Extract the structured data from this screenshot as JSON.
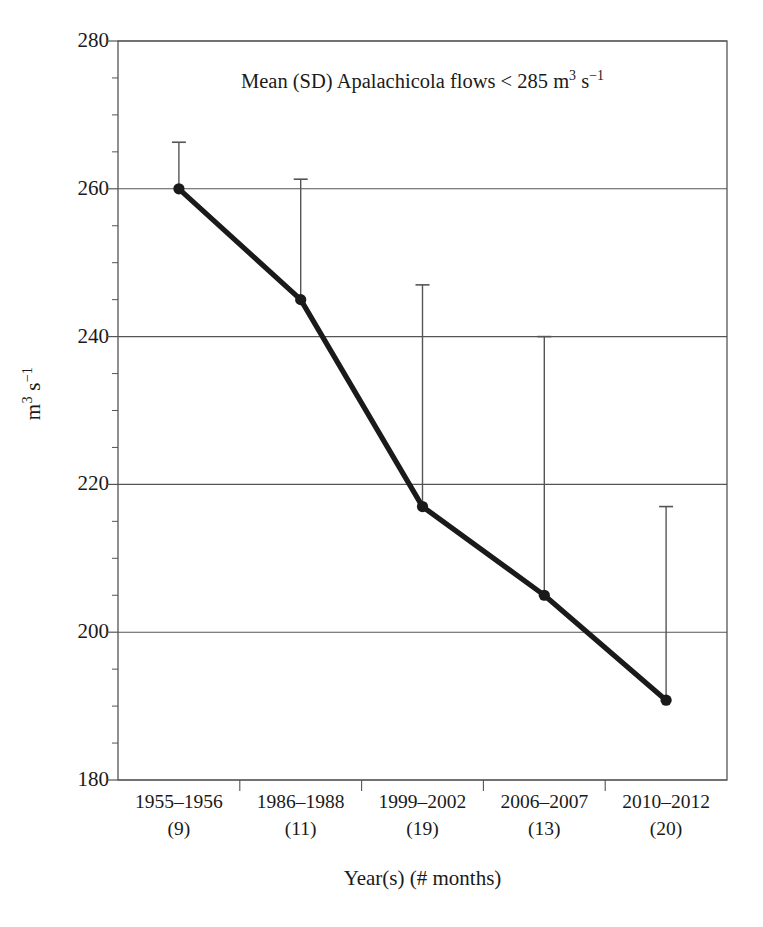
{
  "chart_data": {
    "type": "line",
    "title_parts": {
      "lead": "Mean (SD) Apalachicola flows < 285 m",
      "sup1": "3",
      "mid": " s",
      "sup2": "−1"
    },
    "xlabel": "Year(s) (# months)",
    "ylabel": "m³ s⁻¹",
    "ylabel_parts": {
      "lead": "m",
      "sup1": "3",
      "mid": " s",
      "sup2": "−1"
    },
    "categories": [
      "1955–1956",
      "1986–1988",
      "1999–2002",
      "2006–2007",
      "2010–2012"
    ],
    "category_counts": [
      "(9)",
      "(11)",
      "(19)",
      "(13)",
      "(20)"
    ],
    "values": [
      260,
      245,
      217,
      205,
      190.8
    ],
    "error_upper": [
      266.3,
      261.3,
      247,
      240,
      217
    ],
    "sd": [
      6.3,
      16.3,
      30,
      35,
      26.2
    ],
    "ylim": [
      180,
      280
    ],
    "yticks": [
      280,
      260,
      240,
      220,
      200,
      180
    ],
    "ytick_labels": [
      "280",
      "260",
      "240",
      "220",
      "200",
      "180"
    ],
    "y_minor_step": 5,
    "grid": "horizontal",
    "legend": "none",
    "series_name": "Mean Apalachicola flow",
    "line_color": "#1a1a1a",
    "marker_color": "#1a1a1a",
    "errorbar_color": "#555555",
    "grid_color": "#555555",
    "frame_color": "#555555",
    "background": "#ffffff"
  }
}
